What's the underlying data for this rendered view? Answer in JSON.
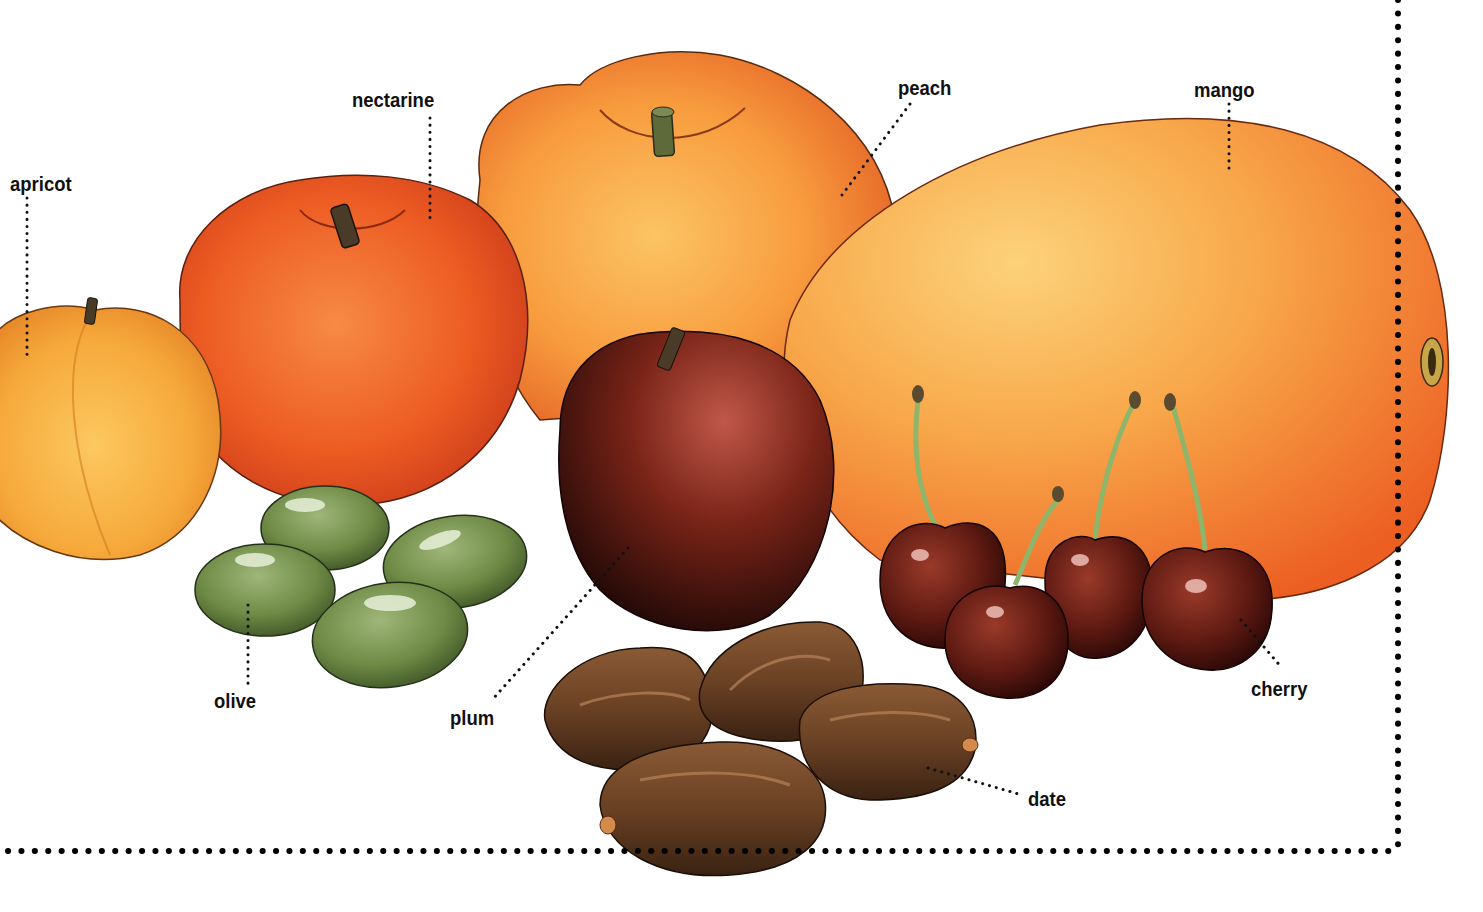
{
  "diagram": {
    "type": "labeled-illustration",
    "background": "#ffffff",
    "frame": {
      "style": "dotted",
      "color": "#000000",
      "edges": [
        "right",
        "bottom"
      ]
    },
    "labels": [
      {
        "id": "apricot",
        "text": "apricot",
        "x": 10,
        "y": 172
      },
      {
        "id": "nectarine",
        "text": "nectarine",
        "x": 352,
        "y": 88
      },
      {
        "id": "peach",
        "text": "peach",
        "x": 898,
        "y": 76
      },
      {
        "id": "mango",
        "text": "mango",
        "x": 1194,
        "y": 78
      },
      {
        "id": "olive",
        "text": "olive",
        "x": 214,
        "y": 689
      },
      {
        "id": "plum",
        "text": "plum",
        "x": 450,
        "y": 706
      },
      {
        "id": "date",
        "text": "date",
        "x": 1028,
        "y": 787
      },
      {
        "id": "cherry",
        "text": "cherry",
        "x": 1251,
        "y": 677
      }
    ],
    "colors": {
      "apricot": "#f6a93a",
      "nectarine": "#e8521f",
      "peach": "#f58b2e",
      "mango": "#f7a544",
      "plum": "#6e1e14",
      "olive": "#6e8a45",
      "cherry": "#5e1a12",
      "date": "#6a4124",
      "stem": "#5a4a30",
      "cherry_stem": "#8fb56a"
    }
  }
}
